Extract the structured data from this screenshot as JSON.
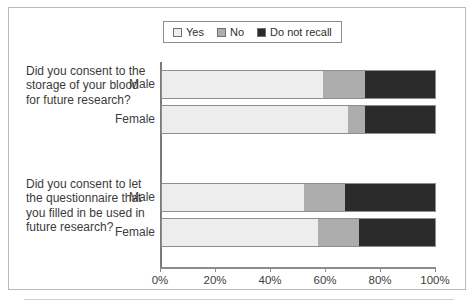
{
  "chart_data": {
    "type": "bar",
    "orientation": "horizontal",
    "stacked": true,
    "stacked_percent": true,
    "title": "",
    "subtitle": "",
    "xlabel": "",
    "ylabel": "",
    "xlim": [
      0,
      100
    ],
    "xtick_labels": [
      "0%",
      "20%",
      "40%",
      "60%",
      "80%",
      "100%"
    ],
    "xticks": [
      0,
      20,
      40,
      60,
      80,
      100
    ],
    "grid": false,
    "legend_position": "top-center",
    "legend": [
      "Yes",
      "No",
      "Do not recall"
    ],
    "colors": {
      "yes": "#ededed",
      "no": "#adadad",
      "do_not_recall": "#2b2b2b",
      "segment_border": "#8e8e8e",
      "axis": "#8b8b8b",
      "frame": "#b9b9b9",
      "text": "#3a3a3a"
    },
    "groups": [
      {
        "question": "Did you consent to the storage of your blood for future research?",
        "categories": [
          "Male",
          "Female"
        ],
        "series": [
          {
            "name": "Yes",
            "values": [
              59,
              68
            ]
          },
          {
            "name": "No",
            "values": [
              15,
              6
            ]
          },
          {
            "name": "Do not recall",
            "values": [
              26,
              26
            ]
          }
        ]
      },
      {
        "question": "Did you consent to let the questionnaire that you filled in be used in future research?",
        "categories": [
          "Male",
          "Female"
        ],
        "series": [
          {
            "name": "Yes",
            "values": [
              52,
              57
            ]
          },
          {
            "name": "No",
            "values": [
              15,
              15
            ]
          },
          {
            "name": "Do not recall",
            "values": [
              33,
              28
            ]
          }
        ]
      }
    ]
  },
  "legend": {
    "items": [
      {
        "label": "Yes",
        "color": "#ededed",
        "swatch_name": "legend-swatch-yes"
      },
      {
        "label": "No",
        "color": "#adadad",
        "swatch_name": "legend-swatch-no"
      },
      {
        "label": "Do not recall",
        "color": "#2b2b2b",
        "swatch_name": "legend-swatch-do-not-recall"
      }
    ]
  },
  "axis": {
    "ticks": [
      {
        "label": "0%",
        "value": 0
      },
      {
        "label": "20%",
        "value": 20
      },
      {
        "label": "40%",
        "value": 40
      },
      {
        "label": "60%",
        "value": 60
      },
      {
        "label": "80%",
        "value": 80
      },
      {
        "label": "100%",
        "value": 100
      }
    ]
  },
  "questions": [
    {
      "text": "Did you consent to the storage of your blood for future research?"
    },
    {
      "text": "Did you consent to let the questionnaire that you filled in be used in future research?"
    }
  ]
}
